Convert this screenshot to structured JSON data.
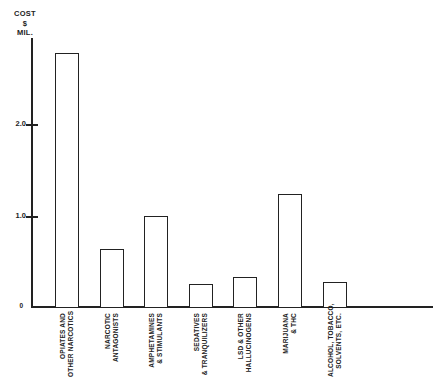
{
  "chart_data": {
    "type": "bar",
    "title": "",
    "ylabel": "COST $ MIL.",
    "ylabel_lines": [
      "COST",
      "$",
      "MIL."
    ],
    "categories": [
      "OPIATES AND OTHER NARCOTICS",
      "NARCOTIC ANTAGONISTS",
      "AMPHETAMINES & STIMULANTS",
      "SEDATIVES & TRANQUILIZERS",
      "LSD & OTHER HALLUCINOGENS",
      "MARIJUANA & THC",
      "ALCOHOL, TOBACCO, SOLVENTS, ETC."
    ],
    "categories_lines": [
      [
        "OPIATES AND",
        "OTHER NARCOTICS"
      ],
      [
        "NARCOTIC",
        "ANTAGONISTS"
      ],
      [
        "AMPHETAMINES",
        "& STIMULANTS"
      ],
      [
        "SEDATIVES",
        "& TRANQUILIZERS"
      ],
      [
        "LSD & OTHER",
        "HALLUCINOGENS"
      ],
      [
        "MARIJUANA",
        "& THC"
      ],
      [
        "ALCOHOL, TOBACCO,",
        "SOLVENTS, ETC."
      ]
    ],
    "values": [
      2.78,
      0.63,
      1.0,
      0.25,
      0.33,
      1.24,
      0.27
    ],
    "yticks": [
      0,
      1.0,
      2.0
    ],
    "ytick_labels": [
      "0",
      "1.0",
      "2.0"
    ],
    "ylim": [
      0,
      2.95
    ],
    "grid": false,
    "bar_fill": "#ffffff",
    "bar_border": "#222222"
  },
  "colors": {
    "ink": "#222222",
    "background": "#ffffff"
  }
}
